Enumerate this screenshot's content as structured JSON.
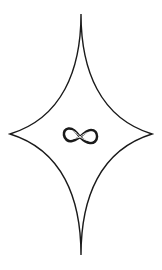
{
  "graphic": {
    "description": "four-pointed concave star (astroid) outline with infinity symbol at center",
    "stroke_color": "#1a1a1a",
    "background_color": "#ffffff",
    "star_points": {
      "top": [
        81,
        14
      ],
      "right": [
        152,
        134
      ],
      "bottom": [
        81,
        255
      ],
      "left": [
        10,
        134
      ]
    },
    "center_icon": "infinity-icon"
  }
}
